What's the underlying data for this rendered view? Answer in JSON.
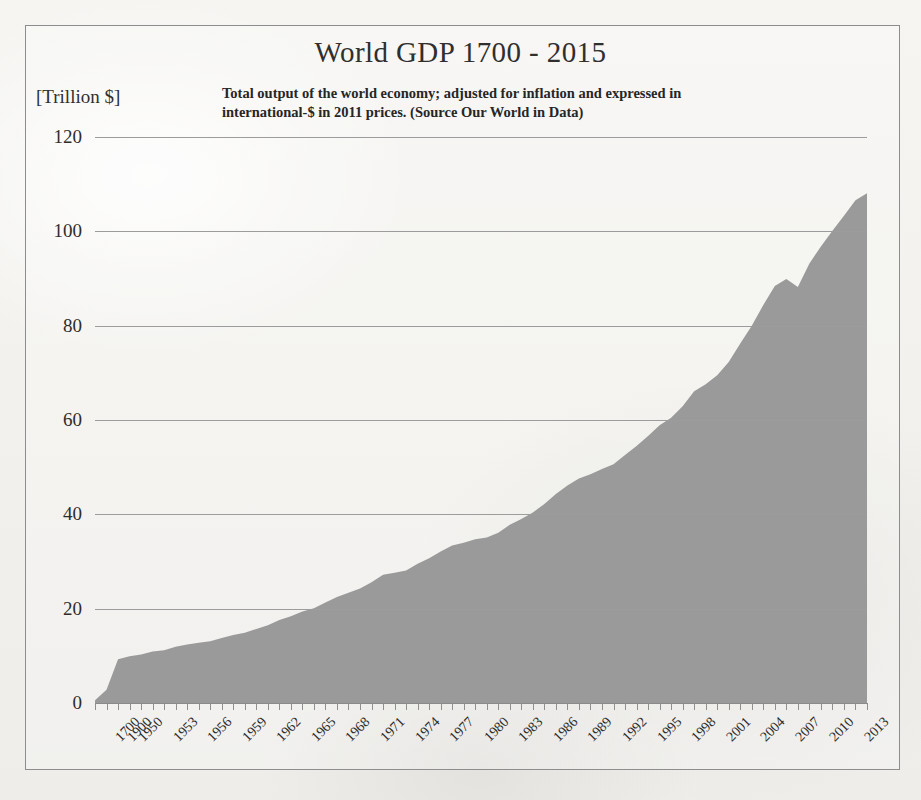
{
  "chart_data": {
    "type": "area",
    "title": "World GDP 1700 - 2015",
    "subtitle": "Total output of the world economy; adjusted for inflation and expressed in international-$ in 2011 prices. (Source Our World in Data)",
    "ylabel": "[Trillion $]",
    "xlabel": "",
    "ylim": [
      0,
      120
    ],
    "ytick_labels": [
      "0",
      "20",
      "40",
      "60",
      "80",
      "100",
      "120"
    ],
    "ytick_values": [
      0,
      20,
      40,
      60,
      80,
      100,
      120
    ],
    "grid": true,
    "legend": "none",
    "series_name": "World GDP",
    "fill_color": "#9a9a9a",
    "xtick_labels": [
      "1700",
      "1900",
      "1950",
      "1953",
      "1956",
      "1959",
      "1962",
      "1965",
      "1968",
      "1971",
      "1974",
      "1977",
      "1980",
      "1983",
      "1986",
      "1989",
      "1992",
      "1995",
      "1998",
      "2001",
      "2004",
      "2007",
      "2010",
      "2013"
    ],
    "x": [
      1700,
      1900,
      1950,
      1951,
      1952,
      1953,
      1954,
      1955,
      1956,
      1957,
      1958,
      1959,
      1960,
      1961,
      1962,
      1963,
      1964,
      1965,
      1966,
      1967,
      1968,
      1969,
      1970,
      1971,
      1972,
      1973,
      1974,
      1975,
      1976,
      1977,
      1978,
      1979,
      1980,
      1981,
      1982,
      1983,
      1984,
      1985,
      1986,
      1987,
      1988,
      1989,
      1990,
      1991,
      1992,
      1993,
      1994,
      1995,
      1996,
      1997,
      1998,
      1999,
      2000,
      2001,
      2002,
      2003,
      2004,
      2005,
      2006,
      2007,
      2008,
      2009,
      2010,
      2011,
      2012,
      2013,
      2014,
      2015
    ],
    "values": [
      0.6,
      2.8,
      9.3,
      9.9,
      10.3,
      10.9,
      11.2,
      11.9,
      12.4,
      12.8,
      13.1,
      13.8,
      14.4,
      14.9,
      15.7,
      16.5,
      17.6,
      18.4,
      19.4,
      20.1,
      21.3,
      22.5,
      23.4,
      24.3,
      25.6,
      27.2,
      27.6,
      28.1,
      29.5,
      30.7,
      32.1,
      33.4,
      34.0,
      34.7,
      35.1,
      36.1,
      37.8,
      39.0,
      40.4,
      42.2,
      44.3,
      46.1,
      47.6,
      48.5,
      49.6,
      50.6,
      52.6,
      54.5,
      56.6,
      58.9,
      60.5,
      62.9,
      66.1,
      67.6,
      69.5,
      72.3,
      76.2,
      80.0,
      84.4,
      88.4,
      89.9,
      88.2,
      93.2,
      96.8,
      100.1,
      103.3,
      106.6,
      108.1
    ],
    "values_unit": "trillion international-$ (2011 prices)",
    "peak_value": 108.1,
    "peak_year": 2015,
    "dip_note": "2009 global financial crisis dip"
  }
}
